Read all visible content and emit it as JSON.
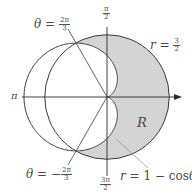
{
  "diagram": {
    "colors": {
      "curve": "#3a3a3a",
      "axis": "#2a2a2a",
      "shade": "#d4d4d4",
      "label": "#4a4a4a",
      "leader_line": "#888888"
    },
    "geometry": {
      "origin_px": [
        107,
        97
      ],
      "scale_px_per_unit": 41.5
    },
    "axis_labels": {
      "top": {
        "num": "π",
        "den": "2"
      },
      "bottom": {
        "num": "3π",
        "den": "2"
      },
      "left": "π"
    },
    "curves": [
      {
        "name": "circle",
        "equation_lhs": "r",
        "equation_eq": "=",
        "equation_rhs_num": "3",
        "equation_rhs_den": "2"
      },
      {
        "name": "cardioid",
        "equation_lhs": "r",
        "equation_eq": "=",
        "equation_rhs": "1 − cos",
        "equation_var": "θ"
      }
    ],
    "rays": [
      {
        "label_var": "θ",
        "label_eq": "=",
        "label_sign": "",
        "num": "2π",
        "den": "3"
      },
      {
        "label_var": "θ",
        "label_eq": "=",
        "label_sign": "−",
        "num": "2π",
        "den": "3"
      }
    ],
    "region_label": "R"
  }
}
